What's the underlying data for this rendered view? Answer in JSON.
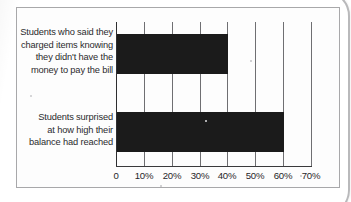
{
  "chart_data": {
    "type": "bar",
    "orientation": "horizontal",
    "title": "",
    "xlabel": "",
    "ylabel": "",
    "categories": [
      "Students who said they\ncharged items knowing\nthey didn't have the\nmoney to pay the bill",
      "Students surprised\nat how high their\nbalance had reached"
    ],
    "values": [
      40,
      60
    ],
    "value_unit": "%",
    "xlim": [
      0,
      70
    ],
    "xticks": [
      0,
      10,
      20,
      30,
      40,
      50,
      60,
      70
    ],
    "xtick_labels": [
      "0",
      "10%",
      "20%",
      "30%",
      "40%",
      "50%",
      "60%",
      "70%"
    ],
    "grid": "vertical",
    "legend": "none",
    "bar_color": "#1b1b1b",
    "gridline_color": "#6f6f72",
    "text_color": "#2b2b2d",
    "background": "#fdfdfd"
  }
}
